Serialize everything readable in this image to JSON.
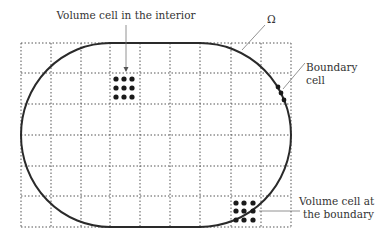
{
  "diagram": {
    "domain_symbol": "Ω",
    "labels": {
      "interior": "Volume cell in the interior",
      "boundary_cell_line1": "Boundary",
      "boundary_cell_line2": "cell",
      "boundary_volume_line1": "Volume cell at",
      "boundary_volume_line2": "the boundary"
    },
    "grid": {
      "columns": 9,
      "rows": 6,
      "style": "dotted"
    },
    "colors": {
      "boundary_curve": "#2a2a2a",
      "grid": "#555555",
      "dots": "#1a1a1a",
      "leader_lines": "#777777"
    }
  }
}
